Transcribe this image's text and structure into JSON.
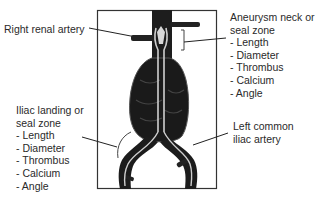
{
  "diagram": {
    "type": "anatomical-annotation"
  },
  "labels": {
    "right_renal": {
      "text": "Right renal artery"
    },
    "neck": {
      "title_line1": "Aneurysm neck or",
      "title_line2": "seal zone",
      "items": [
        "- Length",
        "- Diameter",
        "- Thrombus",
        "- Calcium",
        "- Angle"
      ]
    },
    "iliac_landing": {
      "title_line1": "Iliac landing or",
      "title_line2": "seal zone",
      "items": [
        "- Length",
        "- Diameter",
        "- Thrombus",
        "- Calcium",
        "- Angle"
      ]
    },
    "left_iliac": {
      "line1": "Left common",
      "line2": "iliac artery"
    }
  },
  "colors": {
    "frame": "#333333",
    "vessel": "#1a1a1a",
    "graft": "#c8c8c8",
    "text": "#2a2a2a"
  }
}
